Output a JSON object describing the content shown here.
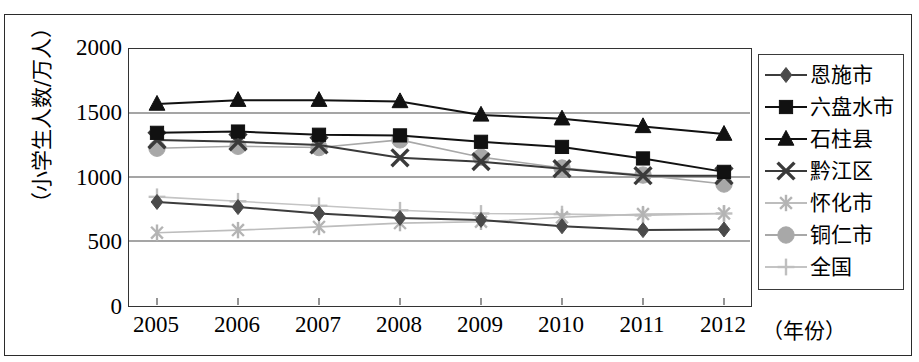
{
  "chart_data": {
    "type": "line",
    "title": "",
    "xlabel": "（年份）",
    "ylabel": "（小学生人数/万人）",
    "x": [
      2005,
      2006,
      2007,
      2008,
      2009,
      2010,
      2011,
      2012
    ],
    "categories": [
      "2005",
      "2006",
      "2007",
      "2008",
      "2009",
      "2010",
      "2011",
      "2012"
    ],
    "xtick_labels": [
      "2005",
      "2006",
      "2007",
      "2008",
      "2009",
      "2010",
      "2011",
      "2012"
    ],
    "ytick_labels": [
      "0",
      "500",
      "1000",
      "1500",
      "2000"
    ],
    "ytick_values": [
      0,
      500,
      1000,
      1500,
      2000
    ],
    "ylim": [
      0,
      2000
    ],
    "grid": true,
    "grid_axis": "y",
    "legend_position": "right",
    "series": [
      {
        "name": "恩施市",
        "marker": "diamond",
        "color": "#4a4a4a",
        "line_color": "#3c3c3c",
        "values": [
          805,
          765,
          715,
          680,
          665,
          615,
          585,
          590
        ]
      },
      {
        "name": "六盘水市",
        "marker": "square",
        "color": "#111111",
        "line_color": "#111111",
        "values": [
          1345,
          1355,
          1330,
          1325,
          1275,
          1235,
          1145,
          1040
        ]
      },
      {
        "name": "石柱县",
        "marker": "triangle",
        "color": "#111111",
        "line_color": "#111111",
        "values": [
          1570,
          1600,
          1600,
          1590,
          1485,
          1455,
          1395,
          1335
        ]
      },
      {
        "name": "黔江区",
        "marker": "x-cross",
        "color": "#3a3a3a",
        "line_color": "#3a3a3a",
        "values": [
          1290,
          1275,
          1250,
          1150,
          1120,
          1065,
          1010,
          1010
        ]
      },
      {
        "name": "怀化市",
        "marker": "asterisk",
        "color": "#b4b4b4",
        "line_color": "#bdbdbd",
        "values": [
          565,
          585,
          610,
          640,
          650,
          685,
          710,
          715
        ]
      },
      {
        "name": "铜仁市",
        "marker": "circle",
        "color": "#a8a8a8",
        "line_color": "#a8a8a8",
        "values": [
          1225,
          1240,
          1230,
          1290,
          1155,
          1070,
          1015,
          945
        ]
      },
      {
        "name": "全国",
        "marker": "plus",
        "color": "#bfbfbf",
        "line_color": "#c4c4c4",
        "values": [
          845,
          810,
          775,
          740,
          715,
          710,
          700,
          715
        ]
      }
    ]
  },
  "axes": {
    "y_title": "（小学生人数/万人）",
    "x_title": "（年份）"
  },
  "legend": {
    "items": [
      {
        "label": "恩施市"
      },
      {
        "label": "六盘水市"
      },
      {
        "label": "石柱县"
      },
      {
        "label": "黔江区"
      },
      {
        "label": "怀化市"
      },
      {
        "label": "铜仁市"
      },
      {
        "label": "全国"
      }
    ]
  }
}
